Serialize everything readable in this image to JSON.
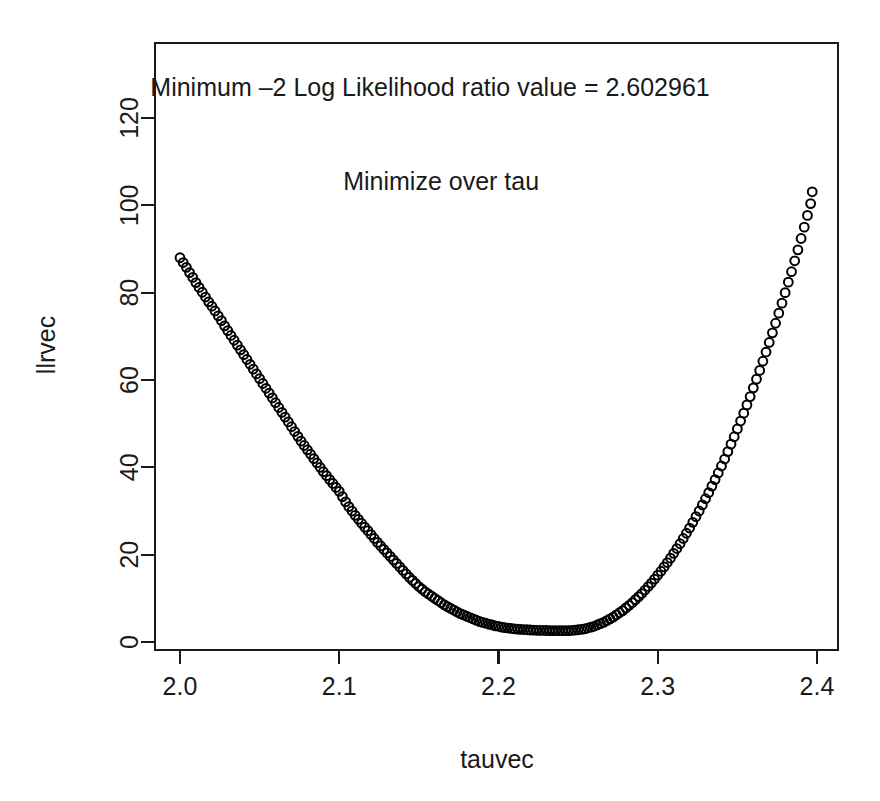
{
  "chart_data": {
    "type": "scatter",
    "title": "",
    "xlabel": "tauvec",
    "ylabel": "llrvec",
    "xlim": [
      1.988,
      2.409
    ],
    "ylim": [
      -5.5,
      137.0
    ],
    "xticks": [
      "2.0",
      "2.1",
      "2.2",
      "2.3",
      "2.4"
    ],
    "xtick_values": [
      2.0,
      2.1,
      2.2,
      2.3,
      2.4
    ],
    "yticks": [
      "0",
      "20",
      "40",
      "60",
      "80",
      "100",
      "120"
    ],
    "ytick_values": [
      0,
      20,
      40,
      60,
      80,
      100,
      120
    ],
    "grid": false,
    "legend": "none",
    "point_marker": "open-circle",
    "point_color": "#000000",
    "minimum_value": 2.602961,
    "minimum_at_tau": 2.164,
    "annotations": [
      {
        "text": "Minimum –2 Log Likelihood ratio value = 2.602961",
        "x": 2.157,
        "y": 125.0
      },
      {
        "text": "Minimize over tau",
        "x": 2.164,
        "y": 103.5
      }
    ],
    "x": [
      2.0,
      2.002,
      2.004,
      2.006,
      2.008,
      2.01,
      2.012,
      2.014,
      2.016,
      2.018,
      2.02,
      2.022,
      2.024,
      2.026,
      2.028,
      2.03,
      2.032,
      2.034,
      2.036,
      2.038,
      2.04,
      2.042,
      2.044,
      2.046,
      2.048,
      2.05,
      2.052,
      2.054,
      2.056,
      2.058,
      2.06,
      2.062,
      2.064,
      2.066,
      2.068,
      2.07,
      2.072,
      2.074,
      2.076,
      2.078,
      2.08,
      2.082,
      2.084,
      2.086,
      2.088,
      2.09,
      2.092,
      2.094,
      2.096,
      2.098,
      2.1,
      2.102,
      2.104,
      2.106,
      2.108,
      2.11,
      2.112,
      2.114,
      2.116,
      2.118,
      2.12,
      2.122,
      2.124,
      2.126,
      2.128,
      2.13,
      2.132,
      2.134,
      2.136,
      2.138,
      2.14,
      2.142,
      2.144,
      2.146,
      2.148,
      2.15,
      2.152,
      2.154,
      2.156,
      2.158,
      2.16,
      2.162,
      2.164,
      2.166,
      2.168,
      2.17,
      2.172,
      2.174,
      2.176,
      2.178,
      2.18,
      2.182,
      2.184,
      2.186,
      2.188,
      2.19,
      2.192,
      2.194,
      2.196,
      2.198,
      2.2,
      2.202,
      2.204,
      2.206,
      2.208,
      2.21,
      2.212,
      2.214,
      2.216,
      2.218,
      2.22,
      2.222,
      2.224,
      2.226,
      2.228,
      2.23,
      2.232,
      2.234,
      2.236,
      2.238,
      2.24,
      2.242,
      2.244,
      2.246,
      2.248,
      2.25,
      2.252,
      2.254,
      2.256,
      2.258,
      2.26,
      2.262,
      2.264,
      2.266,
      2.268,
      2.27,
      2.272,
      2.274,
      2.276,
      2.278,
      2.28,
      2.282,
      2.284,
      2.286,
      2.288,
      2.29,
      2.292,
      2.294,
      2.296,
      2.298,
      2.3,
      2.302,
      2.304,
      2.306,
      2.308,
      2.31,
      2.312,
      2.314,
      2.316,
      2.318,
      2.32,
      2.322,
      2.324,
      2.326,
      2.328,
      2.33,
      2.332,
      2.334,
      2.336,
      2.338,
      2.34,
      2.342,
      2.344,
      2.346,
      2.348,
      2.35,
      2.352,
      2.354,
      2.356,
      2.358,
      2.36,
      2.362,
      2.364,
      2.366,
      2.368,
      2.37,
      2.372,
      2.374,
      2.376,
      2.378,
      2.38,
      2.382,
      2.384,
      2.386,
      2.388,
      2.39,
      2.392,
      2.394,
      2.396,
      2.397
    ],
    "y": [
      88.0,
      86.9,
      85.8,
      84.6,
      83.5,
      82.3,
      81.2,
      80.1,
      79.0,
      77.9,
      76.9,
      75.8,
      74.7,
      73.6,
      72.4,
      71.3,
      70.2,
      69.1,
      68.0,
      66.9,
      65.8,
      64.7,
      63.6,
      62.5,
      61.4,
      60.3,
      59.2,
      58.1,
      57.0,
      55.9,
      54.8,
      53.7,
      52.6,
      51.5,
      50.4,
      49.3,
      48.2,
      47.1,
      46.0,
      45.0,
      44.0,
      43.0,
      42.0,
      41.0,
      40.0,
      39.0,
      38.1,
      37.2,
      36.3,
      35.4,
      34.5,
      33.3,
      32.1,
      31.0,
      30.0,
      29.0,
      28.1,
      27.2,
      26.3,
      25.5,
      24.6,
      23.7,
      22.8,
      22.0,
      21.2,
      20.4,
      19.6,
      18.8,
      18.0,
      17.2,
      16.4,
      15.6,
      14.8,
      14.1,
      13.4,
      12.7,
      12.1,
      11.5,
      11.0,
      10.5,
      10.0,
      9.5,
      9.0,
      8.5,
      8.1,
      7.7,
      7.3,
      6.9,
      6.5,
      6.2,
      5.9,
      5.6,
      5.3,
      5.0,
      4.7,
      4.5,
      4.3,
      4.1,
      3.9,
      3.7,
      3.6,
      3.4,
      3.3,
      3.2,
      3.1,
      3.0,
      2.95,
      2.9,
      2.85,
      2.8,
      2.75,
      2.7,
      2.68,
      2.65,
      2.64,
      2.63,
      2.62,
      2.61,
      2.605,
      2.603,
      2.604,
      2.61,
      2.62,
      2.65,
      2.7,
      2.8,
      2.9,
      3.0,
      3.2,
      3.4,
      3.6,
      3.9,
      4.2,
      4.5,
      4.9,
      5.3,
      5.7,
      6.2,
      6.7,
      7.2,
      7.8,
      8.4,
      9.0,
      9.7,
      10.4,
      11.1,
      11.9,
      12.7,
      13.5,
      14.4,
      15.3,
      16.2,
      17.2,
      18.2,
      19.2,
      20.3,
      21.4,
      22.5,
      23.7,
      24.9,
      26.1,
      27.4,
      28.7,
      30.0,
      31.4,
      32.8,
      34.2,
      35.7,
      37.2,
      38.7,
      40.3,
      41.9,
      43.6,
      45.3,
      47.0,
      48.8,
      50.6,
      52.4,
      54.3,
      56.2,
      58.2,
      60.2,
      62.2,
      64.3,
      66.4,
      68.6,
      70.8,
      73.0,
      75.3,
      77.6,
      80.0,
      82.4,
      84.8,
      87.3,
      89.8,
      92.4,
      95.0,
      97.7,
      100.4,
      103.1,
      105.9,
      108.7,
      111.5,
      114.4,
      117.4,
      120.4,
      123.4,
      126.5,
      129.6,
      132.8
    ]
  }
}
